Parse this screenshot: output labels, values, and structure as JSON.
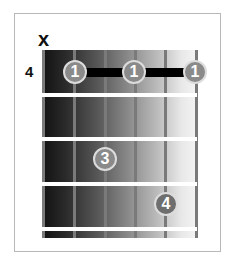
{
  "diagram": {
    "type": "guitar-chord-diagram",
    "muted_marker": "x",
    "start_fret": "4",
    "strings": 6,
    "string_x": [
      43,
      74,
      105,
      135,
      165,
      196
    ],
    "fret_y": [
      95,
      139,
      184,
      229
    ],
    "barre": {
      "finger": "1",
      "from_string": 2,
      "to_string": 6,
      "fret": 1
    },
    "fingers": [
      {
        "label": "1",
        "string": 2,
        "fret": 1,
        "x": 75,
        "y": 72
      },
      {
        "label": "1",
        "string": 4,
        "fret": 1,
        "x": 134,
        "y": 72
      },
      {
        "label": "1",
        "string": 6,
        "fret": 1,
        "x": 195,
        "y": 72
      },
      {
        "label": "3",
        "string": 3,
        "fret": 3,
        "x": 105,
        "y": 159
      },
      {
        "label": "4",
        "string": 5,
        "fret": 4,
        "x": 166,
        "y": 204
      }
    ],
    "colors": {
      "dot": "#8a8a8a",
      "dot_border": "#dcdcdc",
      "barre": "#000000",
      "string": "#7a7a7a",
      "fret": "#ffffff"
    }
  }
}
